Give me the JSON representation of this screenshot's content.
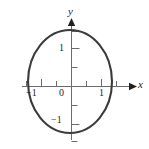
{
  "figure": {
    "kind": "cartesian-plane-with-unit-circle",
    "axes": {
      "x_label": "x",
      "y_label": "y",
      "origin_label": "0"
    },
    "x_ticks": [
      {
        "value": -1.5,
        "label": ""
      },
      {
        "value": -1,
        "label": "−1"
      },
      {
        "value": -0.5,
        "label": ""
      },
      {
        "value": 0.5,
        "label": ""
      },
      {
        "value": 1,
        "label": "1"
      },
      {
        "value": 1.5,
        "label": ""
      }
    ],
    "y_ticks": [
      {
        "value": 1.5,
        "label": ""
      },
      {
        "value": 1,
        "label": "1"
      },
      {
        "value": 0.5,
        "label": ""
      },
      {
        "value": -0.5,
        "label": ""
      },
      {
        "value": -1,
        "label": "−1"
      },
      {
        "value": -1.5,
        "label": ""
      }
    ],
    "curve": {
      "name": "unit-circle",
      "equation_radius": 1,
      "center": [
        0,
        0
      ],
      "stroke": "#3b3b3b",
      "stroke_width": 2.1,
      "fill": "none"
    },
    "colors": {
      "axis": "#6b6b72",
      "curve": "#3b3b3b",
      "text": "#231f20",
      "background": "#ffffff"
    }
  }
}
